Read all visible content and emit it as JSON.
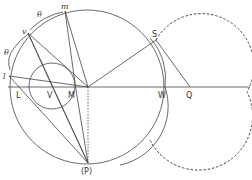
{
  "figure": {
    "labels": {
      "l": "l",
      "v": "v",
      "m": "m",
      "theta1": "θ",
      "theta2": "θ",
      "S": "S",
      "L": "L",
      "V": "V",
      "M": "M",
      "W": "W",
      "Q": "Q",
      "P": "(P)"
    },
    "colors": {
      "stroke": "#444444",
      "text": "#333333",
      "background": "#ffffff"
    }
  }
}
